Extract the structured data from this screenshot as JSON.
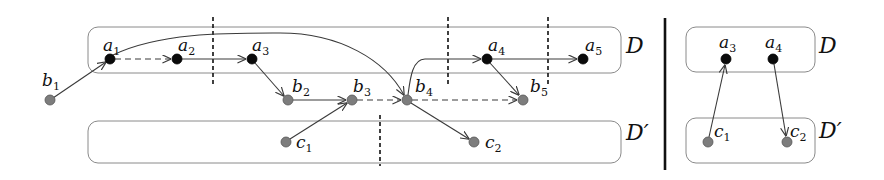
{
  "diagram": {
    "left_panel": {
      "sets": [
        {
          "id": "D",
          "label": "D"
        },
        {
          "id": "Dprime",
          "label": "D′"
        }
      ],
      "nodes": {
        "a1": {
          "name": "a",
          "sub": "1",
          "color": "black",
          "set": "D"
        },
        "a2": {
          "name": "a",
          "sub": "2",
          "color": "black",
          "set": "D"
        },
        "a3": {
          "name": "a",
          "sub": "3",
          "color": "black",
          "set": "D"
        },
        "a4": {
          "name": "a",
          "sub": "4",
          "color": "black",
          "set": "D"
        },
        "a5": {
          "name": "a",
          "sub": "5",
          "color": "black",
          "set": "D"
        },
        "b1": {
          "name": "b",
          "sub": "1",
          "color": "gray"
        },
        "b2": {
          "name": "b",
          "sub": "2",
          "color": "gray"
        },
        "b3": {
          "name": "b",
          "sub": "3",
          "color": "gray"
        },
        "b4": {
          "name": "b",
          "sub": "4",
          "color": "gray"
        },
        "b5": {
          "name": "b",
          "sub": "5",
          "color": "gray"
        },
        "c1": {
          "name": "c",
          "sub": "1",
          "color": "gray",
          "set": "D′"
        },
        "c2": {
          "name": "c",
          "sub": "2",
          "color": "gray",
          "set": "D′"
        }
      },
      "edges": [
        {
          "from": "b1",
          "to": "a1",
          "style": "solid"
        },
        {
          "from": "a1",
          "to": "a2",
          "style": "dashed"
        },
        {
          "from": "a2",
          "to": "a3",
          "style": "solid"
        },
        {
          "from": "a1",
          "to": "b4",
          "style": "solid",
          "curved": true
        },
        {
          "from": "a3",
          "to": "b2",
          "style": "solid"
        },
        {
          "from": "b2",
          "to": "b3",
          "style": "solid"
        },
        {
          "from": "c1",
          "to": "b3",
          "style": "solid"
        },
        {
          "from": "b3",
          "to": "b4",
          "style": "dashed"
        },
        {
          "from": "b4",
          "to": "a4",
          "style": "solid",
          "curved": true
        },
        {
          "from": "b4",
          "to": "b5",
          "style": "dashed"
        },
        {
          "from": "b4",
          "to": "c2",
          "style": "solid"
        },
        {
          "from": "a4",
          "to": "a5",
          "style": "solid"
        },
        {
          "from": "a4",
          "to": "b5",
          "style": "solid"
        }
      ],
      "cut_lines": 4
    },
    "right_panel": {
      "sets": [
        {
          "id": "D",
          "label": "D"
        },
        {
          "id": "Dprime",
          "label": "D′"
        }
      ],
      "nodes": {
        "a3": {
          "name": "a",
          "sub": "3",
          "color": "black",
          "set": "D"
        },
        "a4": {
          "name": "a",
          "sub": "4",
          "color": "black",
          "set": "D"
        },
        "c1": {
          "name": "c",
          "sub": "1",
          "color": "gray",
          "set": "D′"
        },
        "c2": {
          "name": "c",
          "sub": "2",
          "color": "gray",
          "set": "D′"
        }
      },
      "edges": [
        {
          "from": "c1",
          "to": "a3",
          "style": "solid"
        },
        {
          "from": "a4",
          "to": "c2",
          "style": "solid"
        }
      ]
    },
    "colors": {
      "node_black": "#0b0b0b",
      "node_gray": "#7d7d7d",
      "box_stroke": "#8a8a8a",
      "edge": "#3a3a3a"
    }
  }
}
